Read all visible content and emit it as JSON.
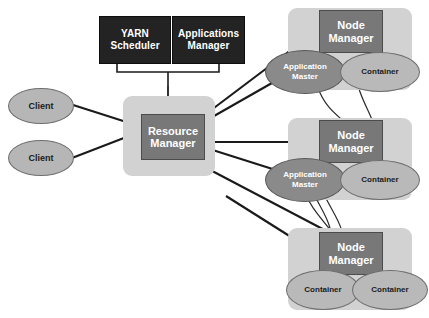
{
  "diagram": {
    "colors": {
      "background": "#ffffff",
      "panel": "#d2d2d2",
      "black_box": "#232323",
      "grey_box": "#787878",
      "client_ellipse": "#b6b6b6",
      "application_master_ellipse": "#8a8a8a",
      "container_ellipse": "#b9b9b9",
      "arrow": "#1a1a1a"
    }
  },
  "resource_manager_group": {
    "scheduler_label": "YARN\nScheduler",
    "applications_manager_label": "Applications\nManager",
    "resource_manager_label": "Resource\nManager"
  },
  "clients": [
    {
      "label": "Client"
    },
    {
      "label": "Client"
    }
  ],
  "nodes": [
    {
      "node_manager_label": "Node\nManager",
      "components": [
        {
          "type": "application-master",
          "label": "Application\nMaster"
        },
        {
          "type": "container",
          "label": "Container"
        }
      ]
    },
    {
      "node_manager_label": "Node\nManager",
      "components": [
        {
          "type": "application-master",
          "label": "Application\nMaster"
        },
        {
          "type": "container",
          "label": "Container"
        }
      ]
    },
    {
      "node_manager_label": "Node\nManager",
      "components": [
        {
          "type": "container",
          "label": "Container"
        },
        {
          "type": "container",
          "label": "Container"
        }
      ]
    }
  ]
}
